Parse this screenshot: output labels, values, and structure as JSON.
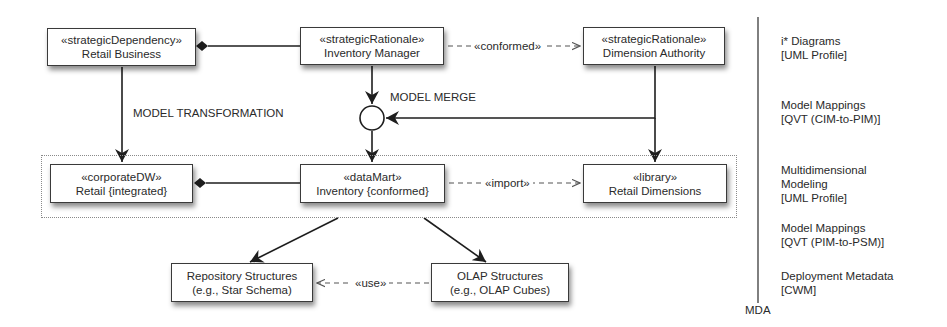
{
  "diagram": {
    "boxes": {
      "retail_business": {
        "stereotype": "«strategicDependency»",
        "name": "Retail Business"
      },
      "inventory_manager": {
        "stereotype": "«strategicRationale»",
        "name": "Inventory Manager"
      },
      "dimension_authority": {
        "stereotype": "«strategicRationale»",
        "name": "Dimension Authority"
      },
      "retail_integrated": {
        "stereotype": "«corporateDW»",
        "name": "Retail {integrated}"
      },
      "inventory_conformed": {
        "stereotype": "«dataMart»",
        "name": "Inventory {conformed}"
      },
      "retail_dimensions": {
        "stereotype": "«library»",
        "name": "Retail Dimensions"
      },
      "repository_structures": {
        "line1": "Repository Structures",
        "line2": "(e.g., Star Schema)"
      },
      "olap_structures": {
        "line1": "OLAP Structures",
        "line2": "(e.g., OLAP Cubes)"
      }
    },
    "edge_labels": {
      "conformed": "«conformed»",
      "import": "«import»",
      "use": "«use»",
      "model_transformation": "MODEL TRANSFORMATION",
      "model_merge": "MODEL MERGE"
    },
    "mda": {
      "label": "MDA",
      "layers": [
        {
          "line1": "i* Diagrams",
          "line2": "[UML Profile]"
        },
        {
          "line1": "Model Mappings",
          "line2": "[QVT (CIM-to-PIM)]"
        },
        {
          "line1": "Multidimensional",
          "line2": "Modeling",
          "line3": "[UML Profile]"
        },
        {
          "line1": "Model Mappings",
          "line2": "[QVT (PIM-to-PSM)]"
        },
        {
          "line1": "Deployment Metadata",
          "line2": "[CWM]"
        }
      ]
    },
    "colors": {
      "line": "#1e1e1e",
      "dashed": "#555555",
      "box_border": "#3a3a3a",
      "text": "#2a2a2a"
    }
  }
}
